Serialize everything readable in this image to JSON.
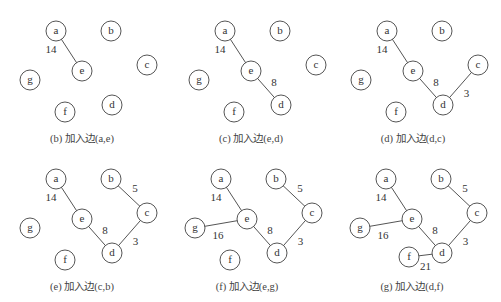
{
  "nodes_base": {
    "a": [
      56,
      31
    ],
    "b": [
      111,
      31
    ],
    "c": [
      147,
      65
    ],
    "e": [
      82,
      71
    ],
    "g": [
      30,
      80
    ],
    "d": [
      112,
      105
    ],
    "f": [
      65,
      112
    ]
  },
  "panels": [
    {
      "id": "b",
      "offset": [
        0,
        0
      ],
      "caption": "(b) 加入边(a,e)",
      "edges": [
        {
          "from": "a",
          "to": "e",
          "weight": "14",
          "lx": -18,
          "ly": -2
        }
      ]
    },
    {
      "id": "c",
      "offset": [
        169,
        0
      ],
      "caption": "(c) 加入边(e,d)",
      "edges": [
        {
          "from": "a",
          "to": "e",
          "weight": "14",
          "lx": -18,
          "ly": -2
        },
        {
          "from": "e",
          "to": "d",
          "weight": "8",
          "lx": 8,
          "ly": -6
        }
      ]
    },
    {
      "id": "d",
      "offset": [
        331,
        0
      ],
      "caption": "(d) 加入边(d,c)",
      "edges": [
        {
          "from": "a",
          "to": "e",
          "weight": "14",
          "lx": -18,
          "ly": -2
        },
        {
          "from": "e",
          "to": "d",
          "weight": "8",
          "lx": 8,
          "ly": -6
        },
        {
          "from": "d",
          "to": "c",
          "weight": "3",
          "lx": 6,
          "ly": 8
        }
      ]
    },
    {
      "id": "e",
      "offset": [
        0,
        148
      ],
      "caption": "(e) 加入边(c,b)",
      "edges": [
        {
          "from": "a",
          "to": "e",
          "weight": "14",
          "lx": -18,
          "ly": -2
        },
        {
          "from": "e",
          "to": "d",
          "weight": "8",
          "lx": 8,
          "ly": -6
        },
        {
          "from": "d",
          "to": "c",
          "weight": "3",
          "lx": 6,
          "ly": 8
        },
        {
          "from": "b",
          "to": "c",
          "weight": "5",
          "lx": 6,
          "ly": -8
        }
      ]
    },
    {
      "id": "f",
      "offset": [
        165,
        148
      ],
      "caption": "(f) 加入边(e,g)",
      "edges": [
        {
          "from": "a",
          "to": "e",
          "weight": "14",
          "lx": -18,
          "ly": -2
        },
        {
          "from": "e",
          "to": "d",
          "weight": "8",
          "lx": 8,
          "ly": -6
        },
        {
          "from": "d",
          "to": "c",
          "weight": "3",
          "lx": 6,
          "ly": 8
        },
        {
          "from": "b",
          "to": "c",
          "weight": "5",
          "lx": 6,
          "ly": -8
        },
        {
          "from": "g",
          "to": "e",
          "weight": "16",
          "lx": -3,
          "ly": 11
        }
      ]
    },
    {
      "id": "g",
      "offset": [
        330,
        148
      ],
      "caption": "(g) 加入边(d,f)",
      "edges": [
        {
          "from": "a",
          "to": "e",
          "weight": "14",
          "lx": -18,
          "ly": -2
        },
        {
          "from": "e",
          "to": "d",
          "weight": "8",
          "lx": 8,
          "ly": -6
        },
        {
          "from": "d",
          "to": "c",
          "weight": "3",
          "lx": 6,
          "ly": 8
        },
        {
          "from": "b",
          "to": "c",
          "weight": "5",
          "lx": 6,
          "ly": -8
        },
        {
          "from": "g",
          "to": "e",
          "weight": "16",
          "lx": -3,
          "ly": 11
        },
        {
          "from": "f",
          "to": "d",
          "weight": "21",
          "lx": 0,
          "ly": 11
        }
      ]
    }
  ],
  "panel_node_overrides": {
    "f": {
      "g": [
        0,
        0
      ],
      "c": [
        0,
        0
      ]
    },
    "g": {
      "f": [
        14,
        -3
      ]
    }
  },
  "caption_y": 142,
  "caption_x": 82
}
